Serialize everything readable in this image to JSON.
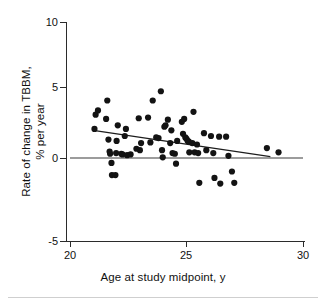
{
  "chart_data": {
    "type": "scatter",
    "title": "",
    "xlabel": "Age at study midpoint, y",
    "ylabel": "Rate of change in TBBM,\n% per year",
    "xlim": [
      20,
      30
    ],
    "ylim": [
      -5,
      10
    ],
    "xticks": [
      20,
      25,
      30
    ],
    "xtick_labels": [
      "20",
      "25",
      "30"
    ],
    "yticks": [
      -5,
      0,
      5,
      10
    ],
    "ytick_labels": [
      "-5",
      "0",
      "5",
      "10"
    ],
    "grid": false,
    "legend": null,
    "marker": "filled-circle",
    "marker_color": "#131313",
    "reference_lines": [
      {
        "name": "zero-line",
        "y": 0,
        "x_from": 20,
        "x_to": 30,
        "color": "#3a3a3a"
      }
    ],
    "trend_line": {
      "name": "regression-line",
      "x_from": 21.0,
      "y_from": 1.95,
      "x_to": 28.6,
      "y_to": 0.1,
      "color": "#1d1d1d"
    },
    "points": [
      {
        "x": 21.05,
        "y": 2.05
      },
      {
        "x": 21.1,
        "y": 3.05
      },
      {
        "x": 21.2,
        "y": 3.35
      },
      {
        "x": 21.55,
        "y": 2.75
      },
      {
        "x": 21.6,
        "y": 4.05
      },
      {
        "x": 21.65,
        "y": 1.3
      },
      {
        "x": 21.7,
        "y": 0.45
      },
      {
        "x": 21.72,
        "y": 0.3
      },
      {
        "x": 21.78,
        "y": -0.35
      },
      {
        "x": 21.8,
        "y": -1.2
      },
      {
        "x": 21.95,
        "y": -1.2
      },
      {
        "x": 21.98,
        "y": 0.35
      },
      {
        "x": 22.0,
        "y": 1.2
      },
      {
        "x": 22.05,
        "y": 2.3
      },
      {
        "x": 22.2,
        "y": 0.3
      },
      {
        "x": 22.25,
        "y": 0.25
      },
      {
        "x": 22.35,
        "y": 1.55
      },
      {
        "x": 22.4,
        "y": 2.05
      },
      {
        "x": 22.45,
        "y": 0.2
      },
      {
        "x": 22.6,
        "y": 0.25
      },
      {
        "x": 22.85,
        "y": 0.65
      },
      {
        "x": 22.95,
        "y": 2.8
      },
      {
        "x": 23.0,
        "y": 0.55
      },
      {
        "x": 23.05,
        "y": 1.05
      },
      {
        "x": 23.35,
        "y": 2.85
      },
      {
        "x": 23.45,
        "y": 1.1
      },
      {
        "x": 23.55,
        "y": 4.05
      },
      {
        "x": 23.7,
        "y": 1.45
      },
      {
        "x": 23.8,
        "y": 1.4
      },
      {
        "x": 23.9,
        "y": 4.7
      },
      {
        "x": 23.95,
        "y": 0.55
      },
      {
        "x": 23.98,
        "y": 0.05
      },
      {
        "x": 24.05,
        "y": 2.2
      },
      {
        "x": 24.1,
        "y": 2.3
      },
      {
        "x": 24.2,
        "y": 2.7
      },
      {
        "x": 24.3,
        "y": 1.05
      },
      {
        "x": 24.35,
        "y": 1.95
      },
      {
        "x": 24.4,
        "y": 0.35
      },
      {
        "x": 24.5,
        "y": 0.3
      },
      {
        "x": 24.55,
        "y": -0.4
      },
      {
        "x": 24.6,
        "y": 1.2
      },
      {
        "x": 24.8,
        "y": 2.55
      },
      {
        "x": 24.85,
        "y": 1.7
      },
      {
        "x": 24.9,
        "y": 2.75
      },
      {
        "x": 24.95,
        "y": 1.45
      },
      {
        "x": 25.0,
        "y": 1.35
      },
      {
        "x": 25.05,
        "y": 1.2
      },
      {
        "x": 25.1,
        "y": 1.15
      },
      {
        "x": 25.12,
        "y": 0.4
      },
      {
        "x": 25.25,
        "y": 1.05
      },
      {
        "x": 25.3,
        "y": 3.25
      },
      {
        "x": 25.35,
        "y": 0.4
      },
      {
        "x": 25.45,
        "y": 0.95
      },
      {
        "x": 25.5,
        "y": 0.35
      },
      {
        "x": 25.55,
        "y": -1.75
      },
      {
        "x": 25.75,
        "y": 1.75
      },
      {
        "x": 25.85,
        "y": 0.55
      },
      {
        "x": 26.05,
        "y": 1.55
      },
      {
        "x": 26.15,
        "y": 0.35
      },
      {
        "x": 26.2,
        "y": -1.4
      },
      {
        "x": 26.4,
        "y": 1.5
      },
      {
        "x": 26.45,
        "y": -1.8
      },
      {
        "x": 26.7,
        "y": 1.5
      },
      {
        "x": 26.8,
        "y": 0.15
      },
      {
        "x": 26.95,
        "y": -0.95
      },
      {
        "x": 27.05,
        "y": -1.75
      },
      {
        "x": 28.45,
        "y": 0.7
      },
      {
        "x": 28.95,
        "y": 0.4
      }
    ]
  },
  "axis": {
    "y_title": "Rate of change in TBBM,\n% per year",
    "x_title": "Age at study midpoint, y",
    "ytick_0": "10",
    "ytick_1": "5",
    "ytick_2": "0",
    "ytick_3": "-5",
    "xtick_0": "20",
    "xtick_1": "25",
    "xtick_2": "30"
  }
}
